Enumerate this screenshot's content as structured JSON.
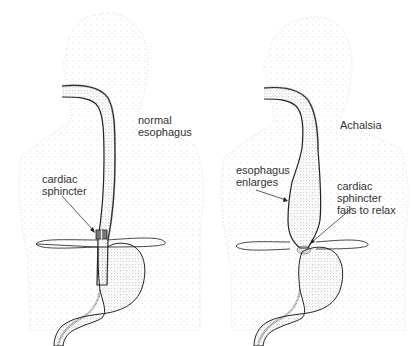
{
  "diagram": {
    "panels": [
      {
        "id": "normal",
        "heading_lines": [
          "normal",
          "esophagus"
        ],
        "callouts": [
          {
            "lines": [
              "cardiac",
              "sphincter"
            ],
            "target": "sphincter band"
          }
        ]
      },
      {
        "id": "achalasia",
        "heading_lines": [
          "Achalsia"
        ],
        "callouts": [
          {
            "lines": [
              "esophagus",
              "enlarges"
            ],
            "target": "dilated esophagus"
          },
          {
            "lines": [
              "cardiac",
              "sphincter",
              "fails to relax"
            ],
            "target": "constricted sphincter"
          }
        ]
      }
    ],
    "colors": {
      "outline": "#222222",
      "stipple": "#555555",
      "body_stipple": "#bbbbbb",
      "text": "#333333",
      "background": "#ffffff"
    }
  }
}
